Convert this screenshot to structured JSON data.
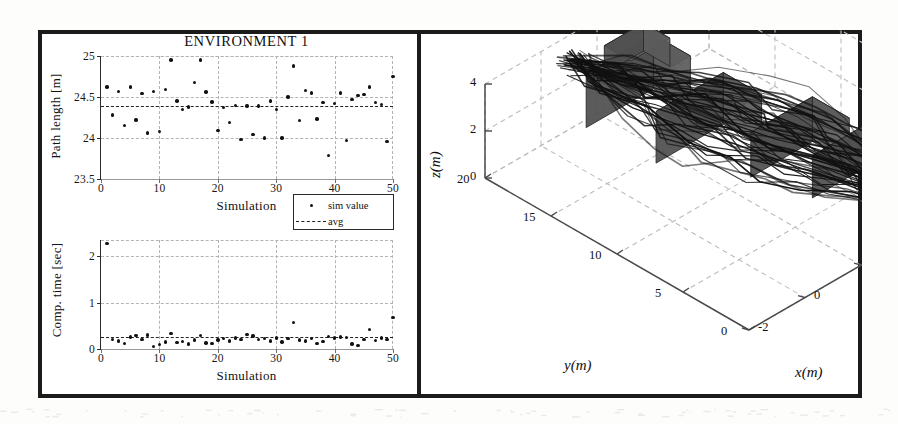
{
  "figure": {
    "title": "ENVIRONMENT 1"
  },
  "legend": {
    "items": [
      {
        "label": "sim value",
        "symbol": "dot"
      },
      {
        "label": "avg",
        "symbol": "dashed-line"
      }
    ]
  },
  "axis3d": {
    "x_name": "x(m)",
    "y_name": "y(m)",
    "z_name": "z(m)",
    "x_ticks": [
      "-2",
      "0",
      "2",
      "4",
      "6"
    ],
    "y_ticks": [
      "0",
      "5",
      "10",
      "15",
      "20"
    ],
    "z_ticks": [
      "0",
      "2",
      "4"
    ]
  },
  "chart_data": [
    {
      "type": "scatter",
      "id": "path-length",
      "title": "ENVIRONMENT 1",
      "xlabel": "Simulation",
      "ylabel": "Path length [m]",
      "xlim": [
        0,
        50
      ],
      "ylim": [
        23.5,
        25
      ],
      "xticks": [
        0,
        10,
        20,
        30,
        40,
        50
      ],
      "yticks": [
        23.5,
        24,
        24.5,
        25
      ],
      "grid": true,
      "legend": [
        "sim value",
        "avg"
      ],
      "legend_position": "below-right",
      "average": 24.39,
      "series": [
        {
          "name": "sim value",
          "x": [
            1,
            2,
            3,
            4,
            5,
            6,
            7,
            8,
            9,
            10,
            11,
            12,
            13,
            14,
            15,
            16,
            17,
            18,
            19,
            20,
            21,
            22,
            23,
            24,
            25,
            26,
            27,
            28,
            29,
            30,
            31,
            32,
            33,
            34,
            35,
            36,
            37,
            38,
            39,
            40,
            41,
            42,
            43,
            44,
            45,
            46,
            47,
            48,
            49,
            50
          ],
          "y": [
            24.62,
            24.28,
            24.57,
            24.15,
            24.62,
            24.22,
            24.54,
            24.06,
            24.57,
            24.08,
            24.59,
            24.95,
            24.45,
            24.35,
            24.38,
            24.68,
            24.95,
            24.56,
            24.44,
            24.09,
            24.37,
            24.19,
            24.4,
            23.98,
            24.39,
            24.04,
            24.39,
            24.0,
            24.45,
            24.35,
            24.0,
            24.5,
            24.88,
            24.21,
            24.58,
            24.55,
            24.23,
            24.43,
            23.79,
            24.42,
            24.55,
            23.97,
            24.47,
            24.52,
            24.53,
            24.62,
            24.43,
            24.41,
            23.96,
            24.75
          ]
        }
      ]
    },
    {
      "type": "scatter",
      "id": "comp-time",
      "title": "",
      "xlabel": "Simulation",
      "ylabel": "Comp. time [sec]",
      "xlim": [
        0,
        50
      ],
      "ylim": [
        0,
        2.35
      ],
      "xticks": [
        0,
        10,
        20,
        30,
        40,
        50
      ],
      "yticks": [
        0,
        1,
        2
      ],
      "grid": true,
      "legend": [
        "sim value",
        "avg"
      ],
      "average": 0.25,
      "series": [
        {
          "name": "sim value",
          "x": [
            1,
            2,
            3,
            4,
            5,
            6,
            7,
            8,
            9,
            10,
            11,
            12,
            13,
            14,
            15,
            16,
            17,
            18,
            19,
            20,
            21,
            22,
            23,
            24,
            25,
            26,
            27,
            28,
            29,
            30,
            31,
            32,
            33,
            34,
            35,
            36,
            37,
            38,
            39,
            40,
            41,
            42,
            43,
            44,
            45,
            46,
            47,
            48,
            49,
            50
          ],
          "y": [
            2.28,
            0.2,
            0.17,
            0.12,
            0.26,
            0.29,
            0.21,
            0.3,
            0.05,
            0.1,
            0.15,
            0.34,
            0.14,
            0.16,
            0.11,
            0.19,
            0.29,
            0.13,
            0.12,
            0.19,
            0.22,
            0.17,
            0.24,
            0.2,
            0.31,
            0.28,
            0.21,
            0.23,
            0.17,
            0.24,
            0.15,
            0.22,
            0.57,
            0.19,
            0.17,
            0.22,
            0.12,
            0.16,
            0.27,
            0.24,
            0.26,
            0.25,
            0.11,
            0.07,
            0.2,
            0.42,
            0.18,
            0.24,
            0.2,
            0.68
          ]
        }
      ]
    },
    {
      "type": "line",
      "id": "trajectory-3d",
      "title": "",
      "xlabel": "x(m)",
      "ylabel": "y(m)",
      "zlabel": "z(m)",
      "xlim": [
        -2,
        6
      ],
      "ylim": [
        0,
        20
      ],
      "zlim": [
        0,
        4
      ],
      "xticks": [
        -2,
        0,
        2,
        4,
        6
      ],
      "yticks": [
        0,
        5,
        10,
        15,
        20
      ],
      "zticks": [
        0,
        2,
        4
      ],
      "grid": true,
      "description": "Overlaid 3D flight paths from 50 simulation runs between a start and goal region, with shaded polygonal obstacles."
    }
  ]
}
